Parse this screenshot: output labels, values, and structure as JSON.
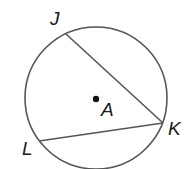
{
  "diagram": {
    "type": "circle-chords",
    "colors": {
      "stroke": "#555555",
      "point": "#111111",
      "label": "#1a1a1a"
    },
    "circle": {
      "center_label": "A",
      "cx": 96,
      "cy": 98,
      "r": 71
    },
    "points": [
      {
        "label": "J",
        "x": 66,
        "y": 34
      },
      {
        "label": "K",
        "x": 163,
        "y": 123
      },
      {
        "label": "L",
        "x": 39,
        "y": 141
      }
    ],
    "chords": [
      {
        "name": "JK",
        "from": "J",
        "to": "K"
      },
      {
        "name": "KL",
        "from": "K",
        "to": "L"
      }
    ],
    "labels": {
      "J": "J",
      "K": "K",
      "L": "L",
      "A": "A"
    }
  }
}
